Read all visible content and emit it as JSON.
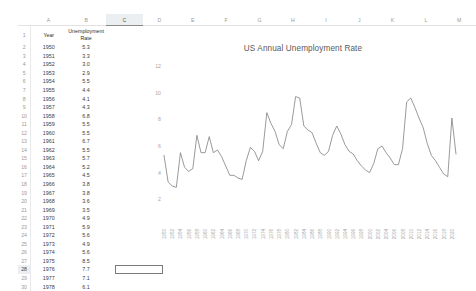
{
  "spreadsheet": {
    "columns": [
      "A",
      "B",
      "C",
      "D",
      "E",
      "F",
      "G",
      "H",
      "I",
      "J",
      "K",
      "L",
      "M"
    ],
    "active_column": "C",
    "active_row": 28,
    "selected_cell": "C28",
    "selected_cell_value": "",
    "headers": {
      "col_a": "Year",
      "col_b_line1": "Unemployment",
      "col_b_line2": "Rate"
    },
    "rows": [
      {
        "n": 1,
        "a": "Year",
        "b": "Rate"
      },
      {
        "n": 2,
        "a": "1950",
        "b": "5.3"
      },
      {
        "n": 3,
        "a": "1951",
        "b": "3.3"
      },
      {
        "n": 4,
        "a": "1952",
        "b": "3.0"
      },
      {
        "n": 5,
        "a": "1953",
        "b": "2.9"
      },
      {
        "n": 6,
        "a": "1954",
        "b": "5.5"
      },
      {
        "n": 7,
        "a": "1955",
        "b": "4.4"
      },
      {
        "n": 8,
        "a": "1956",
        "b": "4.1"
      },
      {
        "n": 9,
        "a": "1957",
        "b": "4.3"
      },
      {
        "n": 10,
        "a": "1958",
        "b": "6.8"
      },
      {
        "n": 11,
        "a": "1959",
        "b": "5.5"
      },
      {
        "n": 12,
        "a": "1960",
        "b": "5.5"
      },
      {
        "n": 13,
        "a": "1961",
        "b": "6.7"
      },
      {
        "n": 14,
        "a": "1962",
        "b": "5.5"
      },
      {
        "n": 15,
        "a": "1963",
        "b": "5.7"
      },
      {
        "n": 16,
        "a": "1964",
        "b": "5.2"
      },
      {
        "n": 17,
        "a": "1965",
        "b": "4.5"
      },
      {
        "n": 18,
        "a": "1966",
        "b": "3.8"
      },
      {
        "n": 19,
        "a": "1967",
        "b": "3.8"
      },
      {
        "n": 20,
        "a": "1968",
        "b": "3.6"
      },
      {
        "n": 21,
        "a": "1969",
        "b": "3.5"
      },
      {
        "n": 22,
        "a": "1970",
        "b": "4.9"
      },
      {
        "n": 23,
        "a": "1971",
        "b": "5.9"
      },
      {
        "n": 24,
        "a": "1972",
        "b": "5.6"
      },
      {
        "n": 25,
        "a": "1973",
        "b": "4.9"
      },
      {
        "n": 26,
        "a": "1974",
        "b": "5.6"
      },
      {
        "n": 27,
        "a": "1975",
        "b": "8.5"
      },
      {
        "n": 28,
        "a": "1976",
        "b": "7.7"
      },
      {
        "n": 29,
        "a": "1977",
        "b": "7.1"
      },
      {
        "n": 30,
        "a": "1978",
        "b": "6.1"
      }
    ]
  },
  "chart_data": {
    "type": "line",
    "title": "US Annual Unemployment Rate",
    "xlabel": "",
    "ylabel": "",
    "ylim": [
      0,
      12
    ],
    "yticks": [
      2,
      4,
      6,
      8,
      10,
      12
    ],
    "grid": false,
    "legend": false,
    "xtick_step": 2,
    "xticks": [
      "1950",
      "1952",
      "1954",
      "1956",
      "1958",
      "1960",
      "1962",
      "1964",
      "1966",
      "1968",
      "1970",
      "1972",
      "1974",
      "1976",
      "1978",
      "1980",
      "1982",
      "1984",
      "1986",
      "1988",
      "1990",
      "1992",
      "1994",
      "1996",
      "1998",
      "2000",
      "2002",
      "2004",
      "2006",
      "2008",
      "2010",
      "2012",
      "2014",
      "2016",
      "2018",
      "2020"
    ],
    "x": [
      1950,
      1951,
      1952,
      1953,
      1954,
      1955,
      1956,
      1957,
      1958,
      1959,
      1960,
      1961,
      1962,
      1963,
      1964,
      1965,
      1966,
      1967,
      1968,
      1969,
      1970,
      1971,
      1972,
      1973,
      1974,
      1975,
      1976,
      1977,
      1978,
      1979,
      1980,
      1981,
      1982,
      1983,
      1984,
      1985,
      1986,
      1987,
      1988,
      1989,
      1990,
      1991,
      1992,
      1993,
      1994,
      1995,
      1996,
      1997,
      1998,
      1999,
      2000,
      2001,
      2002,
      2003,
      2004,
      2005,
      2006,
      2007,
      2008,
      2009,
      2010,
      2011,
      2012,
      2013,
      2014,
      2015,
      2016,
      2017,
      2018,
      2019,
      2020,
      2021
    ],
    "values": [
      5.3,
      3.3,
      3.0,
      2.9,
      5.5,
      4.4,
      4.1,
      4.3,
      6.8,
      5.5,
      5.5,
      6.7,
      5.5,
      5.7,
      5.2,
      4.5,
      3.8,
      3.8,
      3.6,
      3.5,
      4.9,
      5.9,
      5.6,
      4.9,
      5.6,
      8.5,
      7.7,
      7.1,
      6.1,
      5.8,
      7.1,
      7.6,
      9.7,
      9.6,
      7.5,
      7.2,
      7.0,
      6.2,
      5.5,
      5.3,
      5.6,
      6.8,
      7.5,
      6.9,
      6.1,
      5.6,
      5.4,
      4.9,
      4.5,
      4.2,
      4.0,
      4.7,
      5.8,
      6.0,
      5.5,
      5.1,
      4.6,
      4.6,
      5.8,
      9.3,
      9.6,
      8.9,
      8.1,
      7.4,
      6.2,
      5.3,
      4.9,
      4.4,
      3.9,
      3.7,
      8.1,
      5.4
    ],
    "series_name": "Rate",
    "line_color": "#808080"
  }
}
